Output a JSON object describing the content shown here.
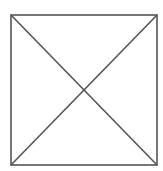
{
  "diagram": {
    "type": "square-with-diagonals",
    "width": 163,
    "height": 171,
    "background": "#ffffff",
    "stroke_color": "#555555",
    "stroke_width": 1.6,
    "square": {
      "x1": 11,
      "y1": 15,
      "x2": 157,
      "y2": 165
    },
    "diagonals": [
      {
        "from": "top-left",
        "to": "bottom-right"
      },
      {
        "from": "top-right",
        "to": "bottom-left"
      }
    ]
  }
}
